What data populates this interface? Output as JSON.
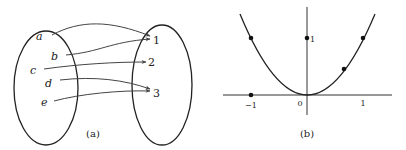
{
  "figure_a": {
    "caption": "(a)",
    "domain_elements": [
      "a",
      "b",
      "c",
      "d",
      "e"
    ],
    "codomain_elements": [
      "1",
      "2",
      "3"
    ],
    "mappings": [
      {
        "from": "a",
        "to": "1"
      },
      {
        "from": "b",
        "to": "1"
      },
      {
        "from": "c",
        "to": "2"
      },
      {
        "from": "d",
        "to": "3"
      },
      {
        "from": "e",
        "to": "3"
      }
    ]
  },
  "figure_b": {
    "caption": "(b)",
    "x_ticks": [
      "−1",
      "0",
      "1"
    ],
    "y_ticks": [
      "1"
    ],
    "function": "y = x^2",
    "points": [
      {
        "x": -1,
        "y": 1
      },
      {
        "x": -1,
        "y": 0
      },
      {
        "x": 0,
        "y": 1
      },
      {
        "x": 0,
        "y": 0
      },
      {
        "x": 0.7,
        "y": 0.49
      },
      {
        "x": 1,
        "y": 1
      }
    ]
  },
  "colors": {
    "stroke": "#222222",
    "background": "#ffffff"
  }
}
